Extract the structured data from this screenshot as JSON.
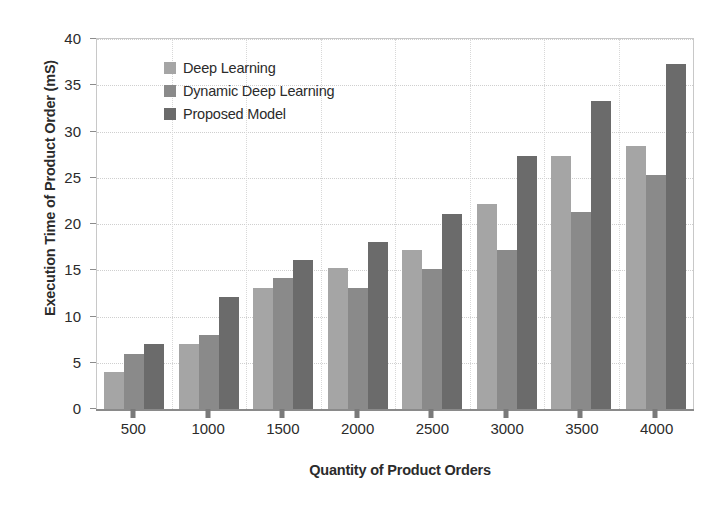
{
  "chart_data": {
    "type": "bar",
    "title": "",
    "xlabel": "Quantity of Product Orders",
    "ylabel": "Execution Time of Product Order (mS)",
    "categories": [
      "500",
      "1000",
      "1500",
      "2000",
      "2500",
      "3000",
      "3500",
      "4000"
    ],
    "series": [
      {
        "name": "Deep Learning",
        "color": "#a5a5a5",
        "values": [
          4.0,
          7.0,
          13.1,
          15.2,
          17.2,
          22.2,
          27.3,
          28.4
        ]
      },
      {
        "name": "Dynamic Deep Learning",
        "color": "#8a8a8a",
        "values": [
          6.0,
          8.0,
          14.2,
          13.1,
          15.1,
          17.2,
          21.3,
          25.3
        ]
      },
      {
        "name": "Proposed Model",
        "color": "#6b6b6b",
        "values": [
          7.0,
          12.1,
          16.1,
          18.1,
          21.1,
          27.3,
          33.3,
          37.3
        ]
      }
    ],
    "ylim": [
      0,
      40
    ],
    "yticks": [
      0,
      5,
      10,
      15,
      20,
      25,
      30,
      35,
      40
    ],
    "ytick_labels": [
      "0",
      "5",
      "10",
      "15",
      "20",
      "25",
      "30",
      "35",
      "40"
    ],
    "grid": true,
    "legend_position": "upper-left-inside"
  }
}
